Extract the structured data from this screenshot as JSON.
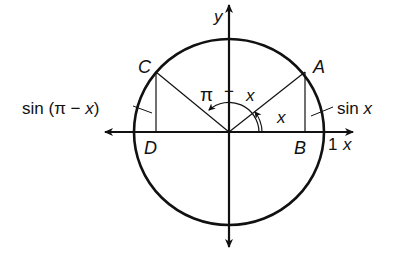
{
  "figure": {
    "type": "unit-circle",
    "stroke_color": "#111111",
    "background": "#ffffff"
  },
  "axes": {
    "x_label": "x",
    "y_label": "y",
    "unit_tick_label": "1"
  },
  "points": {
    "A": "A",
    "B": "B",
    "C": "C",
    "D": "D"
  },
  "angles": {
    "x_angle": "x",
    "pi_minus_x": {
      "pi": "π",
      "minus": "−",
      "x": "x"
    }
  },
  "segment_labels": {
    "sin_x": {
      "func": "sin",
      "arg": "x"
    },
    "sin_pi_minus_x": {
      "func": "sin",
      "open": "(",
      "pi": "π",
      "minus": "−",
      "x": "x",
      "close": ")"
    }
  }
}
